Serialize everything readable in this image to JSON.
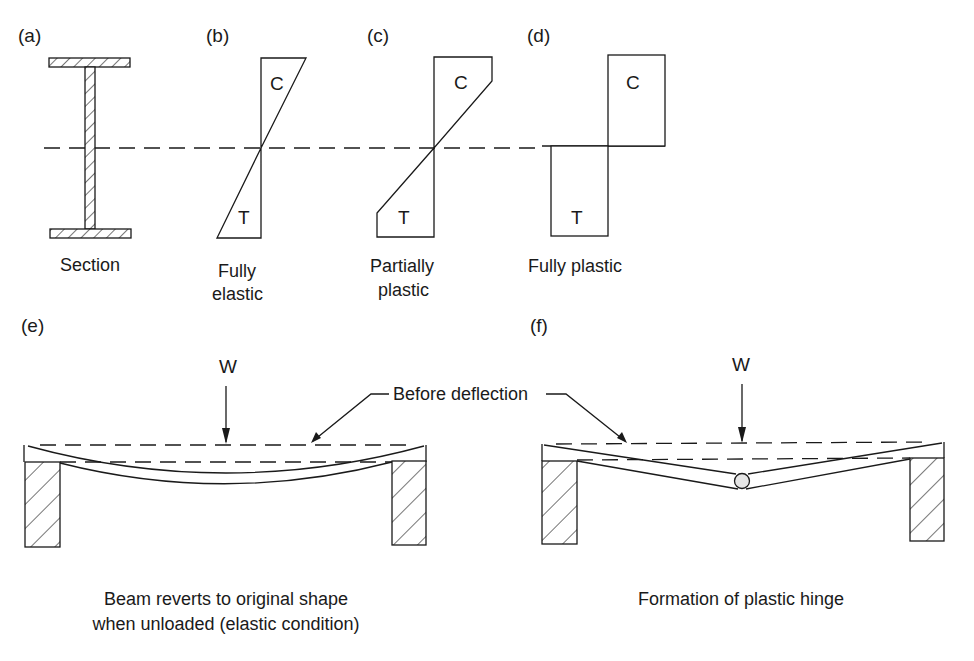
{
  "figure": {
    "panels": {
      "a": {
        "tag": "(a)",
        "caption": "Section"
      },
      "b": {
        "tag": "(b)",
        "caption_line1": "Fully",
        "caption_line2": "elastic",
        "top_label": "C",
        "bottom_label": "T"
      },
      "c": {
        "tag": "(c)",
        "caption_line1": "Partially",
        "caption_line2": "plastic",
        "top_label": "C",
        "bottom_label": "T"
      },
      "d": {
        "tag": "(d)",
        "caption": "Fully plastic",
        "top_label": "C",
        "bottom_label": "T"
      },
      "e": {
        "tag": "(e)",
        "load_label": "W",
        "caption_line1": "Beam reverts to original shape",
        "caption_line2": "when unloaded (elastic condition)"
      },
      "f": {
        "tag": "(f)",
        "load_label": "W",
        "caption": "Formation of plastic hinge"
      }
    },
    "shared_annotation": "Before deflection",
    "legend_symbols": {
      "compression": "C",
      "tension": "T",
      "load": "W"
    },
    "colors": {
      "ink": "#1a1a1a",
      "background": "#ffffff"
    }
  }
}
